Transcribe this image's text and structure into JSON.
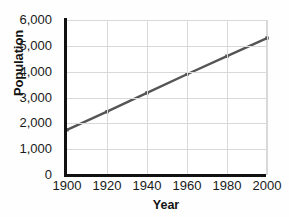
{
  "chart_data": {
    "type": "line",
    "title": "",
    "xlabel": "Year",
    "ylabel": "Population",
    "x": [
      1900,
      1920,
      1940,
      1960,
      1980,
      2000
    ],
    "values": [
      1750,
      2450,
      3180,
      3900,
      4600,
      5300
    ],
    "series": [
      {
        "name": "Population",
        "values": [
          1750,
          2450,
          3180,
          3900,
          4600,
          5300
        ]
      }
    ],
    "xlim": [
      1900,
      2000
    ],
    "ylim": [
      0,
      6000
    ],
    "xticks": [
      1900,
      1920,
      1940,
      1960,
      1980,
      2000
    ],
    "xtick_labels": [
      "1900",
      "1920",
      "1940",
      "1960",
      "1980",
      "2000"
    ],
    "yticks": [
      0,
      1000,
      2000,
      3000,
      4000,
      5000,
      6000
    ],
    "ytick_labels": [
      "0",
      "1,000",
      "2,000",
      "3,000",
      "4,000",
      "5,000",
      "6,000"
    ],
    "grid": true,
    "legend": false,
    "legend_position": "none",
    "line_color": "#555555",
    "marker": "square",
    "marker_color": "#555555",
    "grid_color": "#d9d9d9",
    "axis_color": "#111111",
    "background_color": "#ffffff"
  }
}
